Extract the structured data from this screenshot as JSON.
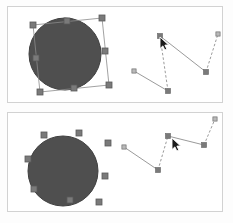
{
  "app": {
    "title": "Vector editor selection comparison",
    "background_color": "#fdfdfd",
    "panel_background_color": "#ffffff",
    "panel_border_color": "#d2d2d2"
  },
  "colors": {
    "shape_fill": "#4f4f4f",
    "shape_stroke": "#3f3f3f",
    "selection_box_stroke": "#8a8a8a",
    "handle_fill": "#7a7a7a",
    "handle_stroke": "#5a5a5a",
    "path_stroke": "#8e8e8e",
    "node_fill": "#b9b9b9",
    "node_stroke": "#6f6f6f",
    "cursor_fill": "#1a1a1a",
    "cursor_stroke": "#ffffff"
  },
  "panels": [
    {
      "id": "panel-top",
      "label": "Before state canvas",
      "circle": {
        "label": "filled-circle-shape",
        "cx": 57,
        "cy": 47,
        "r": 36,
        "selected": true,
        "rotation_deg": -7
      },
      "selection_box": {
        "label": "rotated-selection-bounding-box",
        "visible": true,
        "points": "25,18 94,11 101,78 32,85",
        "handles": [
          {
            "name": "handle-top-left",
            "x": 25,
            "y": 18
          },
          {
            "name": "handle-top-center",
            "x": 59,
            "y": 14
          },
          {
            "name": "handle-top-right",
            "x": 94,
            "y": 11
          },
          {
            "name": "handle-middle-right",
            "x": 97,
            "y": 44
          },
          {
            "name": "handle-bottom-right",
            "x": 101,
            "y": 78
          },
          {
            "name": "handle-bottom-center",
            "x": 66,
            "y": 81
          },
          {
            "name": "handle-bottom-left",
            "x": 32,
            "y": 85
          },
          {
            "name": "handle-middle-left",
            "x": 28,
            "y": 51
          }
        ]
      },
      "path": {
        "label": "editable-polyline-path",
        "nodes": [
          {
            "name": "path-node-1",
            "x": 126,
            "y": 64,
            "selected": false
          },
          {
            "name": "path-node-2",
            "x": 160,
            "y": 84,
            "selected": true
          },
          {
            "name": "path-node-3",
            "x": 152,
            "y": 29,
            "selected": true
          },
          {
            "name": "path-node-4",
            "x": 198,
            "y": 65,
            "selected": true
          },
          {
            "name": "path-node-5",
            "x": 210,
            "y": 27,
            "selected": false
          }
        ],
        "segments": [
          {
            "from": 0,
            "to": 1,
            "style": "solid"
          },
          {
            "from": 1,
            "to": 2,
            "style": "dashed"
          },
          {
            "from": 2,
            "to": 3,
            "style": "solid"
          },
          {
            "from": 3,
            "to": 4,
            "style": "dashed"
          }
        ]
      },
      "cursor": {
        "label": "mouse-pointer-arrow",
        "x": 152,
        "y": 30,
        "visible": true
      }
    },
    {
      "id": "panel-bottom",
      "label": "After state canvas",
      "circle": {
        "label": "filled-circle-shape",
        "cx": 55,
        "cy": 58,
        "r": 35,
        "selected": true,
        "rotation_deg": 0
      },
      "selection_box": {
        "label": "detached-transform-handles",
        "visible": false,
        "points": "",
        "handles": [
          {
            "name": "handle-top-left",
            "x": 36,
            "y": 22
          },
          {
            "name": "handle-top-center",
            "x": 71,
            "y": 20
          },
          {
            "name": "handle-top-right",
            "x": 100,
            "y": 30
          },
          {
            "name": "handle-middle-right",
            "x": 97,
            "y": 63
          },
          {
            "name": "handle-bottom-right",
            "x": 91,
            "y": 89
          },
          {
            "name": "handle-bottom-center",
            "x": 62,
            "y": 87
          },
          {
            "name": "handle-bottom-left",
            "x": 26,
            "y": 76
          },
          {
            "name": "handle-middle-left",
            "x": 20,
            "y": 46
          }
        ]
      },
      "path": {
        "label": "editable-polyline-path",
        "nodes": [
          {
            "name": "path-node-1",
            "x": 116,
            "y": 34,
            "selected": false
          },
          {
            "name": "path-node-2",
            "x": 150,
            "y": 57,
            "selected": true
          },
          {
            "name": "path-node-3",
            "x": 160,
            "y": 23,
            "selected": true
          },
          {
            "name": "path-node-4",
            "x": 196,
            "y": 32,
            "selected": true
          },
          {
            "name": "path-node-5",
            "x": 207,
            "y": 6,
            "selected": false
          }
        ],
        "segments": [
          {
            "from": 0,
            "to": 1,
            "style": "solid"
          },
          {
            "from": 1,
            "to": 2,
            "style": "dashed"
          },
          {
            "from": 2,
            "to": 3,
            "style": "solid"
          },
          {
            "from": 3,
            "to": 4,
            "style": "dashed"
          }
        ]
      },
      "cursor": {
        "label": "mouse-pointer-arrow",
        "x": 164,
        "y": 25,
        "visible": true
      }
    }
  ]
}
